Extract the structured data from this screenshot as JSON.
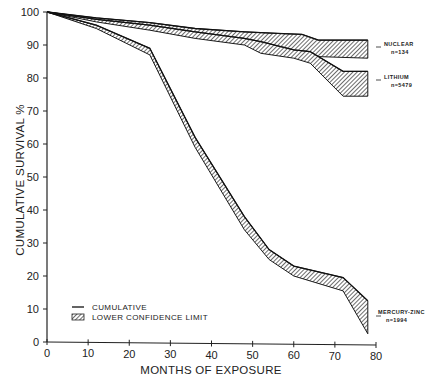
{
  "chart_data": {
    "type": "area",
    "title": "",
    "xlabel": "MONTHS OF EXPOSURE",
    "ylabel": "CUMULATIVE SURVIVAL %",
    "xlim": [
      0,
      80
    ],
    "ylim": [
      0,
      100
    ],
    "xticks": [
      0,
      10,
      20,
      30,
      40,
      50,
      60,
      70,
      80
    ],
    "yticks": [
      0,
      10,
      20,
      30,
      40,
      50,
      60,
      70,
      80,
      90,
      100
    ],
    "grid": false,
    "legend": {
      "position": "lower-left",
      "entries": [
        {
          "label": "CUMULATIVE",
          "style": "line"
        },
        {
          "label": "LOWER CONFIDENCE LIMIT",
          "style": "hatched"
        }
      ]
    },
    "series": [
      {
        "name": "NUCLEAR",
        "n_label": "n=134",
        "x": [
          0,
          12,
          25,
          36,
          48,
          56,
          62,
          66,
          78
        ],
        "cumulative": [
          100,
          98.2,
          96.8,
          95,
          94,
          93.5,
          93.2,
          91.5,
          91.5
        ],
        "lower_confidence": [
          100,
          97.5,
          95,
          92.5,
          91,
          89,
          87.8,
          86.5,
          86
        ]
      },
      {
        "name": "LITHIUM",
        "n_label": "n=5479",
        "x": [
          0,
          12,
          25,
          36,
          48,
          52,
          60,
          64,
          72,
          78
        ],
        "cumulative": [
          100,
          97.8,
          96,
          94,
          92,
          91,
          88.5,
          88,
          82,
          82
        ],
        "lower_confidence": [
          100,
          97,
          94.5,
          92,
          90,
          87.5,
          86,
          84.5,
          74.5,
          74.5
        ]
      },
      {
        "name": "MERCURY-ZINC",
        "n_label": "n=1994",
        "x": [
          0,
          12,
          25,
          36,
          48,
          54,
          60,
          72,
          78
        ],
        "cumulative": [
          100,
          96,
          89,
          62,
          38,
          28,
          23,
          19.5,
          12.5
        ],
        "lower_confidence": [
          100,
          95,
          87,
          59,
          34,
          25,
          20,
          15.5,
          2.5
        ]
      }
    ]
  },
  "labels": {
    "nuclear_name": "NUCLEAR",
    "nuclear_n": "n=134",
    "lithium_name": "LITHIUM",
    "lithium_n": "n=5479",
    "mercury_name": "MERCURY-ZINC",
    "mercury_n": "n=1994",
    "legend_cumulative": "CUMULATIVE",
    "legend_lower": "LOWER CONFIDENCE LIMIT",
    "xlabel": "MONTHS OF EXPOSURE",
    "ylabel": "CUMULATIVE SURVIVAL %"
  }
}
